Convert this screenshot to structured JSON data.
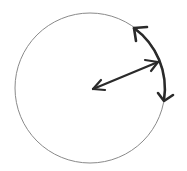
{
  "diagram": {
    "colors": {
      "background": "#ffffff",
      "circle_stroke": "#8a8a8a",
      "arrow_stroke": "#2a2a2a"
    },
    "circle": {
      "cx": 90,
      "cy": 88,
      "r": 75
    },
    "radius_arrow": {
      "from": [
        93,
        89
      ],
      "to": [
        159,
        62
      ],
      "heads": "both"
    },
    "arc_arrow": {
      "start_angle_deg": -65,
      "end_angle_deg": 9,
      "heads": "both"
    }
  }
}
